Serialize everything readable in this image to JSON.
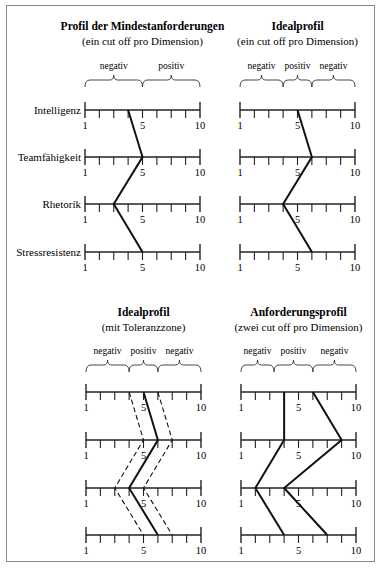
{
  "panels": [
    {
      "id": "mindestanforderungen",
      "title": "Profil der Mindestanforderungen",
      "subtitle": "(ein cut off pro Dimension)",
      "segments": [
        {
          "label": "negativ",
          "from": 1,
          "to": 5
        },
        {
          "label": "positiv",
          "from": 5,
          "to": 9
        }
      ],
      "show_dimension_labels": true
    },
    {
      "id": "idealprofil",
      "title": "Idealprofil",
      "subtitle": "(ein cut off pro Dimension)",
      "segments": [
        {
          "label": "negativ",
          "from": 1,
          "to": 4
        },
        {
          "label": "positiv",
          "from": 4,
          "to": 6
        },
        {
          "label": "negativ",
          "from": 6,
          "to": 9
        }
      ],
      "show_dimension_labels": false
    },
    {
      "id": "idealprofil-toleranz",
      "title": "Idealprofil",
      "subtitle": "(mit Toleranzzone)",
      "segments": [
        {
          "label": "negativ",
          "from": 1,
          "to": 4
        },
        {
          "label": "positiv",
          "from": 4,
          "to": 6
        },
        {
          "label": "negativ",
          "from": 6,
          "to": 9
        }
      ],
      "show_dimension_labels": false
    },
    {
      "id": "anforderungsprofil",
      "title": "Anforderungsprofil",
      "subtitle": "(zwei cut off pro Dimension)",
      "segments": [
        {
          "label": "negativ",
          "from": 1,
          "to": 3.3
        },
        {
          "label": "positiv",
          "from": 3.3,
          "to": 6
        },
        {
          "label": "negativ",
          "from": 6,
          "to": 9
        }
      ],
      "show_dimension_labels": false
    }
  ],
  "dimensions": [
    "Intelligenz",
    "Teamfähigkeit",
    "Rhetorik",
    "Stressresistenz"
  ],
  "scale": {
    "tick_count": 9,
    "labels": [
      {
        "tick": 1,
        "text": "1"
      },
      {
        "tick": 5,
        "text": "5"
      },
      {
        "tick": 9,
        "text": "10"
      }
    ]
  },
  "chart_data": [
    {
      "type": "line",
      "title": "Profil der Mindestanforderungen",
      "subtitle": "(ein cut off pro Dimension)",
      "categories": [
        "Intelligenz",
        "Teamfähigkeit",
        "Rhetorik",
        "Stressresistenz"
      ],
      "scale_labels": [
        "1",
        "5",
        "10"
      ],
      "series": [
        {
          "name": "Mindestanforderung",
          "style": "solid",
          "values": [
            4,
            5,
            3,
            5
          ]
        }
      ]
    },
    {
      "type": "line",
      "title": "Idealprofil",
      "subtitle": "(ein cut off pro Dimension)",
      "categories": [
        "Intelligenz",
        "Teamfähigkeit",
        "Rhetorik",
        "Stressresistenz"
      ],
      "scale_labels": [
        "1",
        "5",
        "10"
      ],
      "series": [
        {
          "name": "Idealprofil",
          "style": "solid",
          "values": [
            5,
            6,
            4,
            6
          ]
        }
      ]
    },
    {
      "type": "line",
      "title": "Idealprofil",
      "subtitle": "(mit Toleranzzone)",
      "categories": [
        "Intelligenz",
        "Teamfähigkeit",
        "Rhetorik",
        "Stressresistenz"
      ],
      "scale_labels": [
        "1",
        "5",
        "10"
      ],
      "series": [
        {
          "name": "Idealprofil",
          "style": "solid",
          "values": [
            5,
            6,
            4,
            6
          ]
        },
        {
          "name": "Toleranz unten",
          "style": "dashed",
          "values": [
            4,
            5,
            3,
            5
          ]
        },
        {
          "name": "Toleranz oben",
          "style": "dashed",
          "values": [
            6,
            7,
            5,
            7
          ]
        }
      ]
    },
    {
      "type": "line",
      "title": "Anforderungsprofil",
      "subtitle": "(zwei cut off pro Dimension)",
      "categories": [
        "Intelligenz",
        "Teamfähigkeit",
        "Rhetorik",
        "Stressresistenz"
      ],
      "scale_labels": [
        "1",
        "5",
        "10"
      ],
      "series": [
        {
          "name": "unterer cut off",
          "style": "solid",
          "values": [
            4,
            4,
            2,
            4
          ]
        },
        {
          "name": "oberer cut off",
          "style": "solid",
          "values": [
            6,
            8,
            4,
            7
          ]
        }
      ]
    }
  ]
}
